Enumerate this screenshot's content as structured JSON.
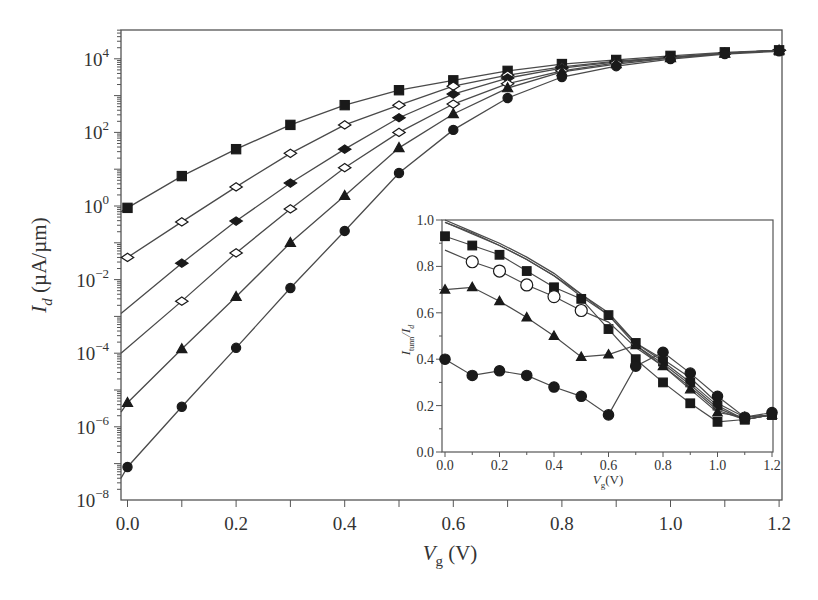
{
  "chart_data": [
    {
      "type": "line",
      "role": "main",
      "title": "",
      "xlabel": "V_g (V)",
      "xlabel_main": "V",
      "xlabel_sub": "g",
      "xlabel_unit": " (V)",
      "ylabel": "I_d (µA/µm)",
      "ylabel_main": "I",
      "ylabel_sub": "d",
      "ylabel_unit": " (µA/µm)",
      "yscale": "log",
      "xlim": [
        0.0,
        1.2
      ],
      "ylim": [
        1e-08,
        100000.0
      ],
      "x_ticks": [
        "0.0",
        "0.2",
        "0.4",
        "0.6",
        "0.8",
        "1.0",
        "1.2"
      ],
      "y_ticks": [
        {
          "base": "10",
          "exp": "4",
          "value": 10000.0
        },
        {
          "base": "10",
          "exp": "2",
          "value": 100.0
        },
        {
          "base": "10",
          "exp": "0",
          "value": 1.0
        },
        {
          "base": "10",
          "exp": "−2",
          "value": 0.01
        },
        {
          "base": "10",
          "exp": "−4",
          "value": 0.0001
        },
        {
          "base": "10",
          "exp": "−6",
          "value": 1e-06
        },
        {
          "base": "10",
          "exp": "−8",
          "value": 1e-08
        }
      ],
      "grid": false,
      "legend": null,
      "x": [
        0.0,
        0.1,
        0.2,
        0.3,
        0.4,
        0.5,
        0.6,
        0.7,
        0.8,
        0.9,
        1.0,
        1.1,
        1.2
      ],
      "series": [
        {
          "name": "filled-square",
          "marker": "square",
          "filled": true,
          "line_start": 0.7,
          "values": [
            0.89,
            6.5,
            35,
            160,
            550,
            1400,
            2600,
            4700,
            7200,
            9300,
            12000,
            15000,
            17000
          ]
        },
        {
          "name": "open-diamond-1",
          "marker": "diamond",
          "filled": false,
          "line_start": 0.04,
          "values": [
            0.04,
            0.37,
            3.3,
            27,
            160,
            550,
            1800,
            3600,
            6000,
            8700,
            11000,
            14000,
            17000
          ]
        },
        {
          "name": "filled-diamond",
          "marker": "diamond",
          "filled": true,
          "line_start": 0.0012,
          "values": [
            null,
            0.028,
            0.39,
            4.2,
            35,
            250,
            1100,
            3000,
            5600,
            8200,
            11000,
            14000,
            17000
          ]
        },
        {
          "name": "open-diamond-2",
          "marker": "diamond",
          "filled": false,
          "line_start": 0.0001,
          "values": [
            null,
            0.0026,
            0.053,
            0.83,
            11,
            100,
            590,
            2100,
            4700,
            7700,
            11000,
            14000,
            17000
          ]
        },
        {
          "name": "filled-triangle",
          "marker": "triangle",
          "filled": true,
          "line_start": 2.5e-06,
          "values": [
            4.5e-06,
            0.00013,
            0.0034,
            0.1,
            1.9,
            38,
            316,
            1600,
            4400,
            7200,
            10500,
            14000,
            17000
          ]
        },
        {
          "name": "filled-circle",
          "marker": "circle",
          "filled": true,
          "line_start": 4e-08,
          "values": [
            8.1e-08,
            3.5e-06,
            0.00014,
            0.0059,
            0.21,
            7.9,
            117,
            860,
            3200,
            6300,
            9800,
            13500,
            16000
          ]
        }
      ]
    },
    {
      "type": "line",
      "role": "inset",
      "title": "",
      "xlabel": "V_g(V)",
      "xlabel_main": "V",
      "xlabel_sub": "g",
      "xlabel_unit": "(V)",
      "ylabel": "I_tunn/I_d",
      "ylabel_main": "I",
      "ylabel_sub": "tunn",
      "ylabel_mid": "/I",
      "ylabel_sub2": "d",
      "xlim": [
        0.0,
        1.2
      ],
      "ylim": [
        0.0,
        1.0
      ],
      "x_ticks": [
        "0.0",
        "0.2",
        "0.4",
        "0.6",
        "0.8",
        "1.0",
        "1.2"
      ],
      "y_ticks": [
        "0.0",
        "0.2",
        "0.4",
        "0.6",
        "0.8",
        "1.0"
      ],
      "grid": false,
      "x": [
        0.0,
        0.1,
        0.2,
        0.3,
        0.4,
        0.5,
        0.6,
        0.7,
        0.8,
        0.9,
        1.0,
        1.1,
        1.2
      ],
      "series": [
        {
          "name": "plain-line-1",
          "marker": "none",
          "filled": false,
          "values": [
            1.0,
            0.95,
            0.9,
            0.84,
            0.77,
            0.68,
            0.6,
            0.47,
            0.4,
            0.32,
            0.21,
            0.15,
            0.16
          ]
        },
        {
          "name": "plain-line-2",
          "marker": "none",
          "filled": false,
          "values": [
            0.99,
            0.945,
            0.89,
            0.83,
            0.76,
            0.67,
            0.59,
            0.46,
            0.38,
            0.29,
            0.19,
            0.14,
            0.16
          ]
        },
        {
          "name": "filled-square-upper",
          "marker": "square",
          "filled": true,
          "marker_from": 0.6,
          "values": [
            0.99,
            0.94,
            0.89,
            0.83,
            0.76,
            0.68,
            0.59,
            0.47,
            0.39,
            0.3,
            0.2,
            0.14,
            0.16
          ]
        },
        {
          "name": "filled-square",
          "marker": "square",
          "filled": true,
          "values": [
            0.93,
            0.89,
            0.85,
            0.78,
            0.71,
            0.66,
            0.53,
            0.4,
            0.3,
            0.21,
            0.13,
            0.14,
            0.16
          ]
        },
        {
          "name": "open-circle",
          "marker": "circle",
          "filled": false,
          "marker_from": 0.1,
          "marker_to": 0.5,
          "values": [
            0.87,
            0.82,
            0.78,
            0.72,
            0.67,
            0.61,
            0.56,
            0.45,
            0.37,
            0.28,
            0.18,
            0.14,
            0.16
          ]
        },
        {
          "name": "filled-triangle",
          "marker": "triangle",
          "filled": true,
          "values": [
            0.7,
            0.71,
            0.65,
            0.58,
            0.5,
            0.41,
            0.42,
            0.46,
            0.37,
            0.27,
            0.17,
            0.15,
            0.16
          ]
        },
        {
          "name": "filled-circle",
          "marker": "circle",
          "filled": true,
          "values": [
            0.4,
            0.33,
            0.35,
            0.33,
            0.28,
            0.24,
            0.16,
            0.37,
            0.43,
            0.34,
            0.24,
            0.15,
            0.17
          ]
        }
      ]
    }
  ],
  "colors": {
    "line": "#4a4a4a",
    "marker": "#1a1a1a",
    "axis": "#555555",
    "text": "#333333",
    "background": "#ffffff"
  }
}
